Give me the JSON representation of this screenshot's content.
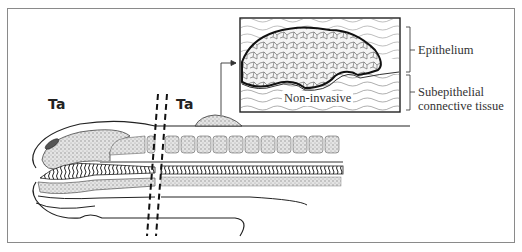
{
  "diagram": {
    "labels": {
      "stage_left": "Ta",
      "stage_right": "Ta",
      "inset_caption": "Non-invasive",
      "layer_top": "Epithelium",
      "layer_bottom_line1": "Subepithelial",
      "layer_bottom_line2": "connective tissue"
    },
    "colors": {
      "frame": "#8a8a8a",
      "ink": "#222222",
      "stipple": "#9a9a9a",
      "background": "#ffffff"
    }
  }
}
